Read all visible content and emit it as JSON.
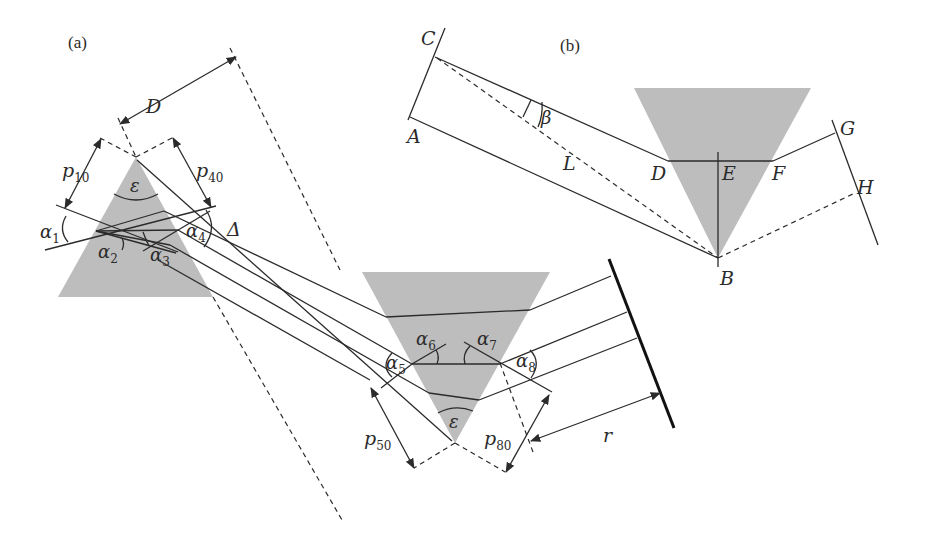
{
  "figure": {
    "panels": [
      {
        "id": "a",
        "label": "(a)"
      },
      {
        "id": "b",
        "label": "(b)"
      }
    ],
    "panel_a": {
      "labels": {
        "D": "D",
        "p10_main": "p",
        "p10_sub": "10",
        "p40_main": "p",
        "p40_sub": "40",
        "p50_main": "p",
        "p50_sub": "50",
        "p80_main": "p",
        "p80_sub": "80",
        "epsilon_top": "ε",
        "epsilon_bottom": "ε",
        "delta": "Δ",
        "r": "r",
        "alpha1_main": "α",
        "alpha1_sub": "1",
        "alpha2_main": "α",
        "alpha2_sub": "2",
        "alpha3_main": "α",
        "alpha3_sub": "3",
        "alpha4_main": "α",
        "alpha4_sub": "4",
        "alpha5_main": "α",
        "alpha5_sub": "5",
        "alpha6_main": "α",
        "alpha6_sub": "6",
        "alpha7_main": "α",
        "alpha7_sub": "7",
        "alpha8_main": "α",
        "alpha8_sub": "8"
      },
      "elements": [
        "upright prism",
        "inverted prism",
        "mirror",
        "rays",
        "dashed construction lines"
      ]
    },
    "panel_b": {
      "labels": {
        "A": "A",
        "B": "B",
        "C": "C",
        "D": "D",
        "E": "E",
        "F": "F",
        "G": "G",
        "H": "H",
        "L": "L",
        "beta": "β"
      },
      "elements": [
        "inverted prism",
        "ray path C-D-F-G",
        "ray A-B",
        "dashed C-B",
        "dashed B-H"
      ]
    },
    "colors": {
      "prism_fill": "#bdbdbd",
      "line": "#2b2b2b",
      "background": "#ffffff"
    }
  }
}
